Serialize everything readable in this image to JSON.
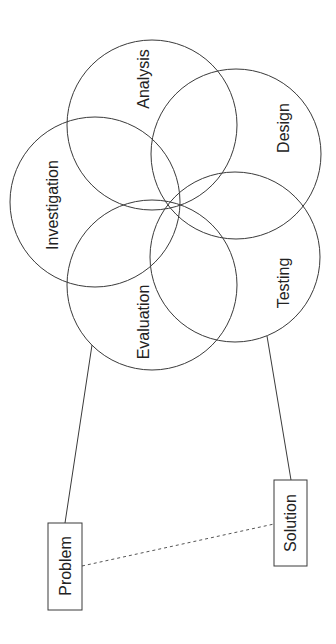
{
  "diagram": {
    "type": "venn-cycle",
    "orientation": "rotated -90deg",
    "circles": [
      {
        "id": "analysis",
        "label": "Analysis",
        "cx": 152,
        "cy": 125,
        "r": 85,
        "label_x": 143,
        "label_y": 79
      },
      {
        "id": "design",
        "label": "Design",
        "cx": 236,
        "cy": 154,
        "r": 85,
        "label_x": 283,
        "label_y": 128
      },
      {
        "id": "investigation",
        "label": "Investigation",
        "cx": 95,
        "cy": 202,
        "r": 85,
        "label_x": 52,
        "label_y": 205
      },
      {
        "id": "testing",
        "label": "Testing",
        "cx": 235,
        "cy": 257,
        "r": 85,
        "label_x": 283,
        "label_y": 283
      },
      {
        "id": "evaluation",
        "label": "Evaluation",
        "cx": 152,
        "cy": 285,
        "r": 85,
        "label_x": 143,
        "label_y": 322
      }
    ],
    "boxes": [
      {
        "id": "problem",
        "label": "Problem",
        "x": 48,
        "y": 523,
        "w": 34,
        "h": 87
      },
      {
        "id": "solution",
        "label": "Solution",
        "x": 274,
        "y": 480,
        "w": 33,
        "h": 86
      }
    ],
    "connectors": [
      {
        "from": "evaluation",
        "to": "problem",
        "style": "solid"
      },
      {
        "from": "testing",
        "to": "solution",
        "style": "solid"
      },
      {
        "from": "problem",
        "to": "solution",
        "style": "dashed"
      }
    ],
    "colors": {
      "stroke": "#3a3a3a",
      "text": "#222222",
      "background": "#ffffff"
    }
  }
}
